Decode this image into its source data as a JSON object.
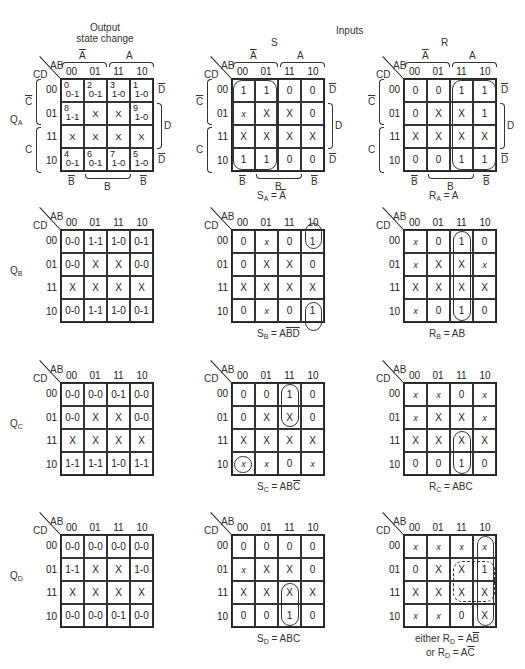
{
  "headers": {
    "output_title_line1": "Output",
    "output_title_line2": "state change",
    "inputs_title": "Inputs",
    "s_title": "S",
    "r_title": "R"
  },
  "axis": {
    "ab": "AB",
    "cd": "CD",
    "cols": [
      "00",
      "01",
      "11",
      "10"
    ],
    "rows": [
      "00",
      "01",
      "11",
      "10"
    ],
    "a_bar": "A",
    "a": "A",
    "c_bar": "C",
    "c": "C",
    "d_bar": "D",
    "d": "D",
    "b_bar": "B",
    "b": "B"
  },
  "rows": [
    {
      "label": "Q",
      "label_sub": "A",
      "output": {
        "cells": [
          [
            {
              "i": "0",
              "v": "0-1"
            },
            {
              "i": "2",
              "v": "0-1"
            },
            {
              "i": "3",
              "v": "1-0"
            },
            {
              "i": "1",
              "v": "1-0"
            }
          ],
          [
            {
              "i": "8",
              "v": "1-1"
            },
            {
              "i": "",
              "v": "X"
            },
            {
              "i": "",
              "v": "X"
            },
            {
              "i": "9",
              "v": "1-0"
            }
          ],
          [
            {
              "i": "",
              "v": "X"
            },
            {
              "i": "",
              "v": "X"
            },
            {
              "i": "",
              "v": "X"
            },
            {
              "i": "",
              "v": "X"
            }
          ],
          [
            {
              "i": "4",
              "v": "0-1"
            },
            {
              "i": "6",
              "v": "0-1"
            },
            {
              "i": "7",
              "v": "1-0"
            },
            {
              "i": "5",
              "v": "1-0"
            }
          ]
        ]
      },
      "s": {
        "cells": [
          [
            "1",
            "1",
            "0",
            "0"
          ],
          [
            "x",
            "X",
            "X",
            "0"
          ],
          [
            "X",
            "X",
            "X",
            "X"
          ],
          [
            "1",
            "1",
            "0",
            "0"
          ]
        ],
        "eq_lhs": "S",
        "eq_sub": "A",
        "eq_rhs": "A",
        "eq_rhs_bar": true
      },
      "r": {
        "cells": [
          [
            "0",
            "0",
            "1",
            "1"
          ],
          [
            "0",
            "X",
            "X",
            "1"
          ],
          [
            "X",
            "X",
            "X",
            "X"
          ],
          [
            "0",
            "0",
            "1",
            "1"
          ]
        ],
        "eq_lhs": "R",
        "eq_sub": "A",
        "eq_rhs": "A"
      }
    },
    {
      "label": "Q",
      "label_sub": "B",
      "output": {
        "cells": [
          [
            "0-0",
            "1-1",
            "1-0",
            "0-1"
          ],
          [
            "0-0",
            "X",
            "X",
            "0-0"
          ],
          [
            "X",
            "X",
            "X",
            "X"
          ],
          [
            "0-0",
            "1-1",
            "1-0",
            "0-1"
          ]
        ]
      },
      "s": {
        "cells": [
          [
            "0",
            "x",
            "0",
            "1"
          ],
          [
            "0",
            "X",
            "X",
            "0"
          ],
          [
            "X",
            "X",
            "X",
            "X"
          ],
          [
            "0",
            "x",
            "0",
            "1"
          ]
        ],
        "eq_lhs": "S",
        "eq_sub": "B",
        "eq_rhs_plain": "A",
        "eq_rhs_bar": "BD"
      },
      "r": {
        "cells": [
          [
            "x",
            "0",
            "1",
            "0"
          ],
          [
            "x",
            "X",
            "X",
            "x"
          ],
          [
            "X",
            "X",
            "X",
            "X"
          ],
          [
            "x",
            "0",
            "1",
            "0"
          ]
        ],
        "eq_lhs": "R",
        "eq_sub": "B",
        "eq_rhs": "AB"
      }
    },
    {
      "label": "Q",
      "label_sub": "C",
      "output": {
        "cells": [
          [
            "0-0",
            "0-0",
            "0-1",
            "0-0"
          ],
          [
            "0-0",
            "X",
            "X",
            "0-0"
          ],
          [
            "X",
            "X",
            "X",
            "X"
          ],
          [
            "1-1",
            "1-1",
            "1-0",
            "1-1"
          ]
        ]
      },
      "s": {
        "cells": [
          [
            "0",
            "0",
            "1",
            "0"
          ],
          [
            "0",
            "X",
            "X",
            "0"
          ],
          [
            "X",
            "X",
            "X",
            "X"
          ],
          [
            "x",
            "x",
            "0",
            "x"
          ]
        ],
        "eq_lhs": "S",
        "eq_sub": "C",
        "eq_rhs_plain": "AB",
        "eq_rhs_bar": "C"
      },
      "r": {
        "cells": [
          [
            "x",
            "x",
            "0",
            "x"
          ],
          [
            "x",
            "X",
            "X",
            "x"
          ],
          [
            "X",
            "X",
            "X",
            "X"
          ],
          [
            "0",
            "0",
            "1",
            "0"
          ]
        ],
        "eq_lhs": "R",
        "eq_sub": "C",
        "eq_rhs": "ABC"
      }
    },
    {
      "label": "Q",
      "label_sub": "D",
      "output": {
        "cells": [
          [
            "0-0",
            "0-0",
            "0-0",
            "0-0"
          ],
          [
            "1-1",
            "X",
            "X",
            "1-0"
          ],
          [
            "X",
            "X",
            "X",
            "X"
          ],
          [
            "0-0",
            "0-0",
            "0-1",
            "0-0"
          ]
        ]
      },
      "s": {
        "cells": [
          [
            "0",
            "0",
            "0",
            "0"
          ],
          [
            "x",
            "X",
            "X",
            "0"
          ],
          [
            "X",
            "X",
            "X",
            "X"
          ],
          [
            "0",
            "0",
            "1",
            "0"
          ]
        ],
        "eq_lhs": "S",
        "eq_sub": "D",
        "eq_rhs": "ABC"
      },
      "r": {
        "cells": [
          [
            "x",
            "x",
            "x",
            "x"
          ],
          [
            "0",
            "X",
            "X",
            "1"
          ],
          [
            "X",
            "X",
            "X",
            "X"
          ],
          [
            "x",
            "x",
            "0",
            "X"
          ]
        ],
        "eq1_prefix": "either R",
        "eq1_sub": "D",
        "eq1_plain": "A",
        "eq1_bar": "B",
        "eq2_prefix": "or R",
        "eq2_sub": "D",
        "eq2_plain": "A",
        "eq2_bar": "C"
      }
    }
  ]
}
